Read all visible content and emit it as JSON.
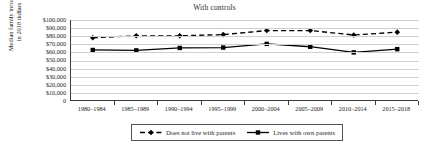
{
  "chart_data": {
    "type": "line",
    "title": "With controls",
    "xlabel": "",
    "ylabel_line1": "Median family income",
    "ylabel_line2": "in 2018 dollars",
    "categories": [
      "1980–1984",
      "1985–1989",
      "1990–1994",
      "1995–1999",
      "2000–2004",
      "2005–2009",
      "2010–2014",
      "2015–2018"
    ],
    "ylim": [
      0,
      100000
    ],
    "ytick_labels": [
      "$100,000",
      "$90,000",
      "$80,000",
      "$70,000",
      "$60,000",
      "$50,000",
      "$40,000",
      "$30,000",
      "$20,000",
      "$10,000",
      "0"
    ],
    "ytick_values": [
      100000,
      90000,
      80000,
      70000,
      60000,
      50000,
      40000,
      30000,
      20000,
      10000,
      0
    ],
    "grid": true,
    "legend_position": "bottom",
    "series": [
      {
        "name": "Does not live with parents",
        "values": [
          78000,
          80500,
          80500,
          82000,
          87000,
          87000,
          81500,
          85000
        ],
        "line_style": "dashed",
        "marker": "diamond",
        "color": "#000000"
      },
      {
        "name": "Lives with own parents",
        "values": [
          63000,
          62500,
          65500,
          66000,
          70500,
          67000,
          60000,
          64000
        ],
        "line_style": "solid",
        "marker": "square",
        "color": "#000000"
      }
    ]
  },
  "legend": {
    "entries": [
      {
        "label": "Does not live with parents"
      },
      {
        "label": "Lives with own parents"
      }
    ]
  }
}
